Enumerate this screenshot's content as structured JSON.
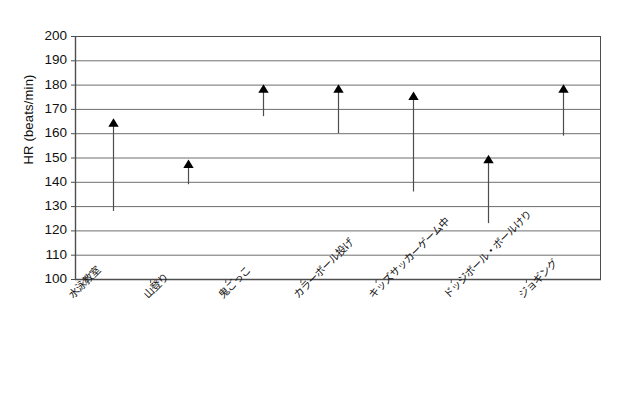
{
  "chart_data": {
    "type": "bar",
    "title": "",
    "subtitle": "",
    "xlabel": "",
    "ylabel": "HR (beats/min)",
    "ylim": [
      100,
      200
    ],
    "ytick_step": 10,
    "yticks": [
      200,
      190,
      180,
      170,
      160,
      150,
      140,
      130,
      120,
      110,
      100
    ],
    "grid": true,
    "grid_axis": "y",
    "legend": "none",
    "marker": "triangle-up",
    "series_style": "vertical-range-line-with-top-arrow-marker",
    "categories": [
      "水泳教室",
      "山登り",
      "鬼ごっこ",
      "カラーボール投げ",
      "キッズサッカーゲーム中",
      "ドッジボール・ボールけり",
      "ジョギング"
    ],
    "series": [
      {
        "name": "HR range (min to max)",
        "low": [
          128,
          139,
          167,
          160,
          136,
          123,
          159
        ],
        "high": [
          164,
          147,
          178,
          178,
          175,
          149,
          178
        ]
      }
    ]
  },
  "axis": {
    "y_title": "HR (beats/min)"
  },
  "colors": {
    "line": "#4d4d4d",
    "marker": "#000000",
    "grid": "#6e6e6e",
    "axis": "#4d4d4d",
    "text": "#111111",
    "background": "#ffffff"
  }
}
